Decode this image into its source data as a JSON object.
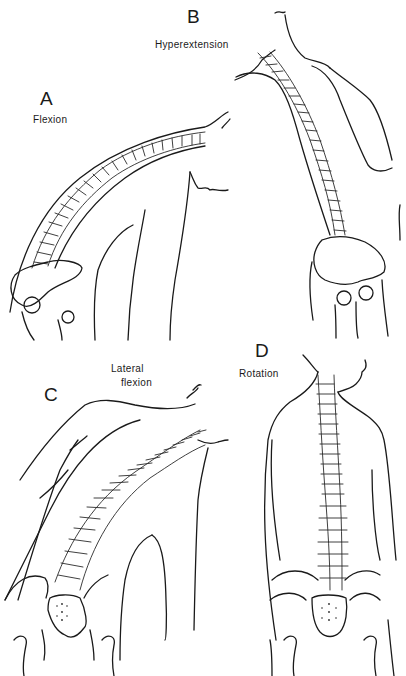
{
  "figure": {
    "panels": [
      {
        "letter": "A",
        "caption": "Flexion"
      },
      {
        "letter": "B",
        "caption": "Hyperextension"
      },
      {
        "letter": "C",
        "caption_line1": "Lateral",
        "caption_line2": "flexion"
      },
      {
        "letter": "D",
        "caption": "Rotation"
      }
    ],
    "colors": {
      "line": "#1a1a1a",
      "background": "#ffffff"
    }
  }
}
